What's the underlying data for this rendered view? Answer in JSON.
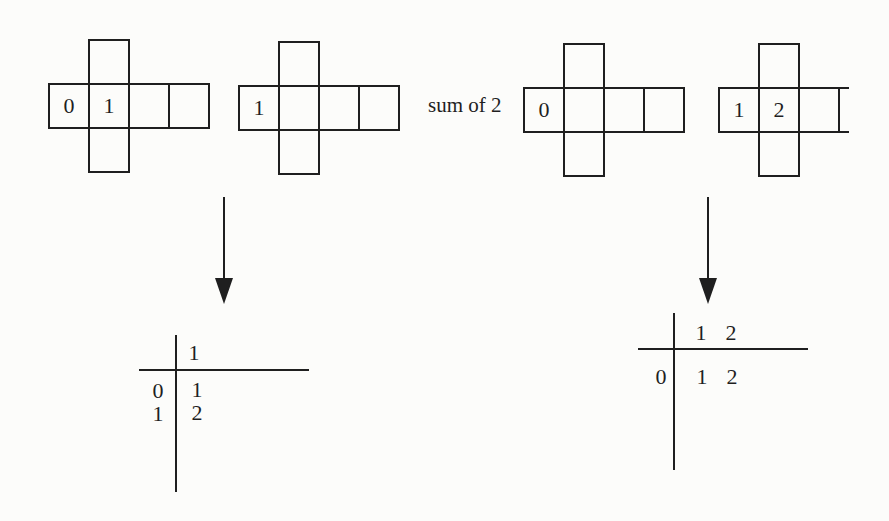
{
  "figure": {
    "sum_label": "sum of 2",
    "nets": [
      {
        "row": [
          "0",
          "1",
          "",
          ""
        ]
      },
      {
        "row": [
          "1",
          "",
          "",
          ""
        ]
      },
      {
        "row": [
          "0",
          "",
          "",
          ""
        ]
      },
      {
        "row": [
          "1",
          "2",
          ""
        ]
      }
    ],
    "tables": [
      {
        "col_headers": [
          "1"
        ],
        "row_headers": [
          "0",
          "1"
        ],
        "cells": [
          [
            "1"
          ],
          [
            "2"
          ]
        ]
      },
      {
        "col_headers": [
          "1",
          "2"
        ],
        "row_headers": [
          "0"
        ],
        "cells": [
          [
            "1",
            "2"
          ]
        ]
      }
    ]
  },
  "colors": {
    "ink": "#1f1f1f",
    "background": "#fcfcfa"
  }
}
